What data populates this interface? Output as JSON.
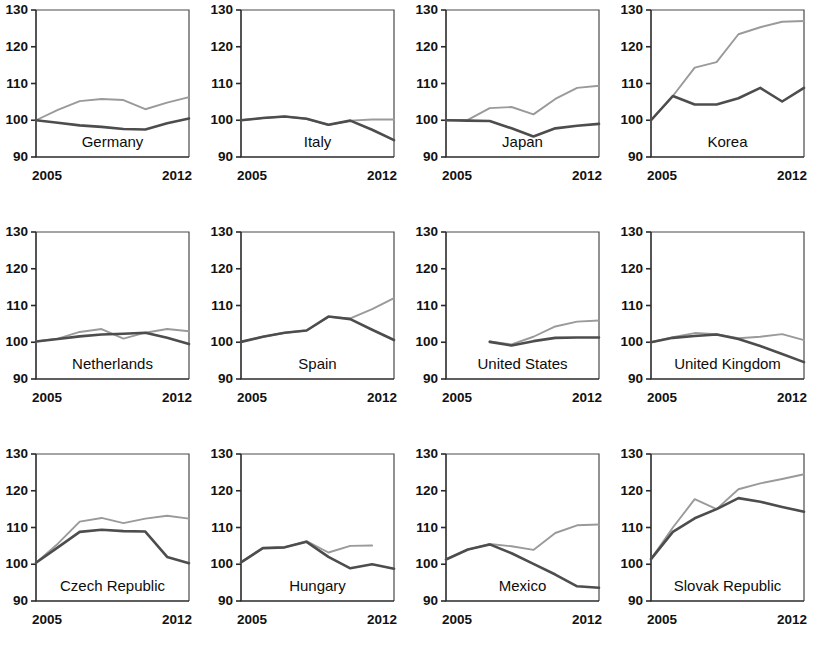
{
  "figure": {
    "panel_rows": 3,
    "panel_cols": 4,
    "y_axis": {
      "min": 90,
      "max": 130,
      "ticks": [
        90,
        100,
        110,
        120,
        130
      ],
      "tick_labels": [
        "90",
        "100",
        "110",
        "120",
        "130"
      ]
    },
    "x_axis": {
      "min": 2005,
      "max": 2012,
      "ticks": [
        2005,
        2012
      ],
      "tick_labels": [
        "2005",
        "2012"
      ]
    },
    "colors": {
      "series_light": "#9a9a9a",
      "series_dark": "#4d4d4d",
      "axis": "#2b2b2b",
      "frame": "#4a4a4a",
      "background": "#ffffff"
    }
  },
  "chart_data": {
    "type": "line",
    "title": "",
    "xlabel": "",
    "ylabel": "",
    "xlim": [
      2005,
      2012
    ],
    "ylim": [
      90,
      130
    ],
    "grid": false,
    "legend": "none",
    "index_base": 100,
    "x": [
      2005,
      2006,
      2007,
      2008,
      2009,
      2010,
      2011,
      2012
    ],
    "panels": [
      {
        "title": "Germany",
        "row": 0,
        "col": 0,
        "series": [
          {
            "name": "light",
            "x": [
              2005,
              2006,
              2007,
              2008,
              2009,
              2010,
              2011,
              2012
            ],
            "values": [
              100.0,
              102.8,
              105.2,
              105.8,
              105.5,
              103.0,
              104.8,
              106.3
            ]
          },
          {
            "name": "dark",
            "x": [
              2005,
              2006,
              2007,
              2008,
              2009,
              2010,
              2011,
              2012
            ],
            "values": [
              100.0,
              99.3,
              98.6,
              98.2,
              97.6,
              97.5,
              99.2,
              100.5
            ]
          }
        ]
      },
      {
        "title": "Italy",
        "row": 0,
        "col": 1,
        "series": [
          {
            "name": "light",
            "x": [
              2005,
              2006,
              2007,
              2008,
              2009,
              2010,
              2011,
              2012
            ],
            "values": [
              100.0,
              100.6,
              101.0,
              100.4,
              98.7,
              99.9,
              100.2,
              100.2
            ]
          },
          {
            "name": "dark",
            "x": [
              2005,
              2006,
              2007,
              2008,
              2009,
              2010,
              2011,
              2012
            ],
            "values": [
              100.0,
              100.6,
              101.0,
              100.4,
              98.8,
              99.9,
              97.4,
              94.6
            ]
          }
        ]
      },
      {
        "title": "Japan",
        "row": 0,
        "col": 2,
        "series": [
          {
            "name": "light",
            "x": [
              2005,
              2006,
              2007,
              2008,
              2009,
              2010,
              2011,
              2012
            ],
            "values": [
              100.0,
              100.1,
              103.3,
              103.6,
              101.6,
              105.8,
              108.8,
              109.4
            ]
          },
          {
            "name": "dark",
            "x": [
              2005,
              2006,
              2007,
              2008,
              2009,
              2010,
              2011,
              2012
            ],
            "values": [
              100.0,
              99.9,
              99.8,
              97.8,
              95.6,
              97.8,
              98.5,
              99.0
            ]
          }
        ]
      },
      {
        "title": "Korea",
        "row": 0,
        "col": 3,
        "series": [
          {
            "name": "light",
            "x": [
              2005,
              2006,
              2007,
              2008,
              2009,
              2010,
              2011,
              2012
            ],
            "values": [
              100.0,
              106.6,
              114.3,
              115.8,
              123.4,
              125.3,
              126.8,
              127.0
            ]
          },
          {
            "name": "dark",
            "x": [
              2005,
              2006,
              2007,
              2008,
              2009,
              2010,
              2011,
              2012
            ],
            "values": [
              100.0,
              106.6,
              104.3,
              104.3,
              106.0,
              108.8,
              105.1,
              108.8
            ]
          }
        ]
      },
      {
        "title": "Netherlands",
        "row": 1,
        "col": 0,
        "series": [
          {
            "name": "light",
            "x": [
              2005,
              2006,
              2007,
              2008,
              2009,
              2010,
              2011,
              2012
            ],
            "values": [
              100.2,
              101.0,
              102.8,
              103.6,
              101.0,
              102.6,
              103.6,
              103.0
            ]
          },
          {
            "name": "dark",
            "x": [
              2005,
              2006,
              2007,
              2008,
              2009,
              2010,
              2011,
              2012
            ],
            "values": [
              100.2,
              100.9,
              101.6,
              102.1,
              102.3,
              102.6,
              101.2,
              99.5
            ]
          }
        ]
      },
      {
        "title": "Spain",
        "row": 1,
        "col": 1,
        "series": [
          {
            "name": "light",
            "x": [
              2005,
              2006,
              2007,
              2008,
              2009,
              2010,
              2011,
              2012
            ],
            "values": [
              100.1,
              101.5,
              102.6,
              103.2,
              106.9,
              106.5,
              109.0,
              112.0
            ]
          },
          {
            "name": "dark",
            "x": [
              2005,
              2006,
              2007,
              2008,
              2009,
              2010,
              2011,
              2012
            ],
            "values": [
              100.1,
              101.5,
              102.6,
              103.2,
              107.0,
              106.3,
              103.4,
              100.6
            ]
          }
        ]
      },
      {
        "title": "United States",
        "row": 1,
        "col": 2,
        "series": [
          {
            "name": "light",
            "x": [
              2007,
              2008,
              2009,
              2010,
              2011,
              2012
            ],
            "values": [
              100.2,
              99.4,
              101.5,
              104.3,
              105.6,
              105.9
            ]
          },
          {
            "name": "dark",
            "x": [
              2007,
              2008,
              2009,
              2010,
              2011,
              2012
            ],
            "values": [
              100.1,
              99.1,
              100.3,
              101.2,
              101.3,
              101.3
            ]
          }
        ]
      },
      {
        "title": "United Kingdom",
        "row": 1,
        "col": 3,
        "series": [
          {
            "name": "light",
            "x": [
              2005,
              2006,
              2007,
              2008,
              2009,
              2010,
              2011,
              2012
            ],
            "values": [
              100.0,
              101.4,
              102.5,
              102.2,
              101.1,
              101.5,
              102.2,
              100.6
            ]
          },
          {
            "name": "dark",
            "x": [
              2005,
              2006,
              2007,
              2008,
              2009,
              2010,
              2011,
              2012
            ],
            "values": [
              100.0,
              101.2,
              101.7,
              102.1,
              100.9,
              99.0,
              96.8,
              94.6
            ]
          }
        ]
      },
      {
        "title": "Czech Republic",
        "row": 2,
        "col": 0,
        "series": [
          {
            "name": "light",
            "x": [
              2005,
              2006,
              2007,
              2008,
              2009,
              2010,
              2011,
              2012
            ],
            "values": [
              100.4,
              105.6,
              111.6,
              112.6,
              111.2,
              112.4,
              113.2,
              112.4
            ]
          },
          {
            "name": "dark",
            "x": [
              2005,
              2006,
              2007,
              2008,
              2009,
              2010,
              2011,
              2012
            ],
            "values": [
              100.4,
              104.6,
              108.8,
              109.4,
              109.0,
              108.9,
              102.0,
              100.3
            ]
          }
        ]
      },
      {
        "title": "Hungary",
        "row": 2,
        "col": 1,
        "series": [
          {
            "name": "light",
            "x": [
              2005,
              2006,
              2007,
              2008,
              2009,
              2010,
              2011
            ],
            "values": [
              100.5,
              104.4,
              104.6,
              106.3,
              103.2,
              105.0,
              105.1
            ]
          },
          {
            "name": "dark",
            "x": [
              2005,
              2006,
              2007,
              2008,
              2009,
              2010,
              2011,
              2012
            ],
            "values": [
              100.5,
              104.4,
              104.6,
              106.1,
              102.0,
              98.9,
              100.0,
              98.8
            ]
          }
        ]
      },
      {
        "title": "Mexico",
        "row": 2,
        "col": 2,
        "series": [
          {
            "name": "light",
            "x": [
              2005,
              2006,
              2007,
              2008,
              2009,
              2010,
              2011,
              2012
            ],
            "values": [
              101.3,
              104.0,
              105.5,
              104.9,
              103.9,
              108.5,
              110.6,
              110.8
            ]
          },
          {
            "name": "dark",
            "x": [
              2005,
              2006,
              2007,
              2008,
              2009,
              2010,
              2011,
              2012
            ],
            "values": [
              101.3,
              104.0,
              105.4,
              103.0,
              100.1,
              97.2,
              94.0,
              93.6
            ]
          }
        ]
      },
      {
        "title": "Slovak Republic",
        "row": 2,
        "col": 3,
        "series": [
          {
            "name": "light",
            "x": [
              2005,
              2006,
              2007,
              2008,
              2009,
              2010,
              2011,
              2012
            ],
            "values": [
              101.4,
              110.0,
              117.7,
              115.0,
              120.4,
              122.0,
              123.2,
              124.5
            ]
          },
          {
            "name": "dark",
            "x": [
              2005,
              2006,
              2007,
              2008,
              2009,
              2010,
              2011,
              2012
            ],
            "values": [
              101.4,
              108.8,
              112.5,
              115.0,
              118.0,
              117.0,
              115.6,
              114.3
            ]
          }
        ]
      }
    ]
  }
}
